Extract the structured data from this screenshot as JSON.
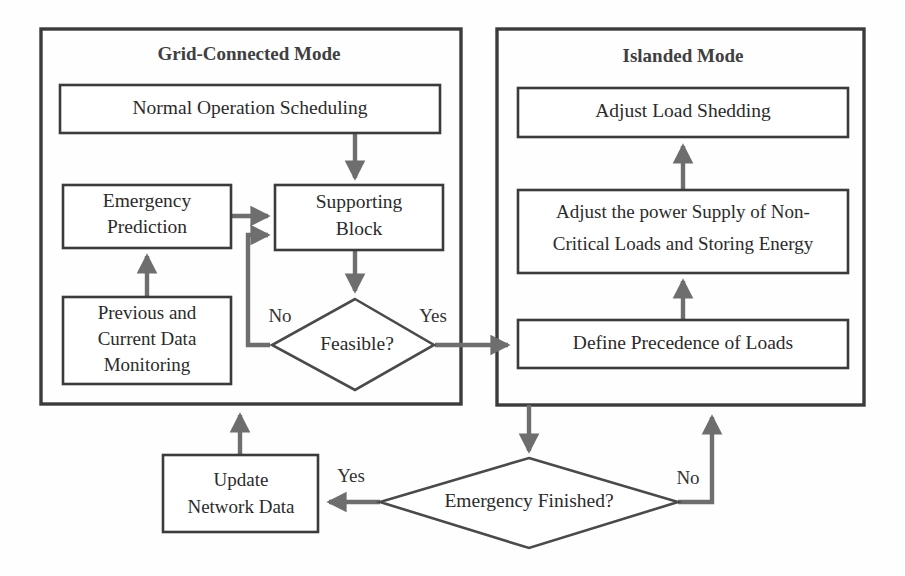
{
  "diagram": {
    "colors": {
      "box_stroke": "#3b3b3b",
      "panel_stroke": "#3b3b3b",
      "arrow": "#6e6e6e",
      "text": "#2b2b2b",
      "background": "#fefefe"
    },
    "panels": [
      {
        "id": "grid-connected",
        "title": "Grid-Connected Mode"
      },
      {
        "id": "islanded",
        "title": "Islanded Mode"
      }
    ],
    "nodes": {
      "normal_operation": "Normal Operation Scheduling",
      "emergency_prediction_line1": "Emergency",
      "emergency_prediction_line2": "Prediction",
      "supporting_block_line1": "Supporting",
      "supporting_block_line2": "Block",
      "data_monitoring_line1": "Previous and",
      "data_monitoring_line2": "Current Data",
      "data_monitoring_line3": "Monitoring",
      "feasible": "Feasible?",
      "adjust_load_shedding": "Adjust Load Shedding",
      "adjust_power_line1": "Adjust the power Supply of Non-",
      "adjust_power_line2": "Critical Loads and Storing Energy",
      "define_precedence": "Define Precedence of Loads",
      "update_network_line1": "Update",
      "update_network_line2": "Network Data",
      "emergency_finished": "Emergency Finished?"
    },
    "edge_labels": {
      "feasible_no": "No",
      "feasible_yes": "Yes",
      "finished_yes": "Yes",
      "finished_no": "No"
    }
  }
}
